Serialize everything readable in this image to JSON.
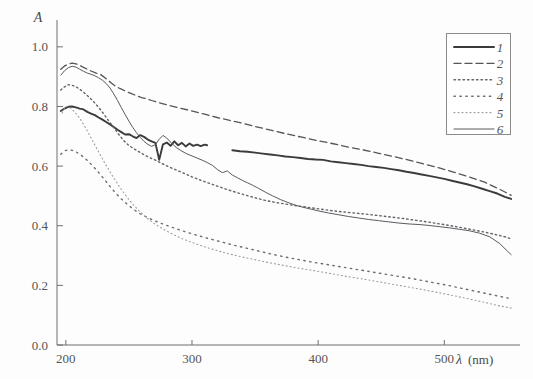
{
  "chart_data": {
    "type": "line",
    "title": "",
    "subtitle": "",
    "xlabel": "λ (nm)",
    "xlabel_symbol": "λ",
    "xlabel_unit": "(nm)",
    "ylabel": "A",
    "xlim": [
      193,
      560
    ],
    "ylim": [
      0.0,
      1.09
    ],
    "grid": false,
    "legend_position": "top-right",
    "xticks": [
      200,
      300,
      400,
      500
    ],
    "xtick_labels": [
      "200",
      "300",
      "400",
      "500"
    ],
    "yticks": [
      0.0,
      0.2,
      0.4,
      0.6,
      0.8,
      1.0
    ],
    "ytick_labels": [
      "0.0",
      "0.2",
      "0.4",
      "0.6",
      "0.8",
      "1.0"
    ],
    "series": [
      {
        "name": "1",
        "legend_label": "1",
        "style": "solid-thick",
        "color": "#3b3b3b",
        "width": 1.9,
        "dash": "",
        "note": "thick solid, data gap between 312 and 332 nm",
        "segments": [
          {
            "x": [
              196,
              199,
              202,
              205,
              208,
              211,
              214,
              217,
              220,
              223,
              226,
              229,
              232,
              235,
              238,
              241,
              244,
              247,
              250,
              253,
              256,
              259,
              262,
              265,
              268,
              271,
              274,
              277,
              280,
              283,
              286,
              289,
              292,
              295,
              298,
              301,
              304,
              307,
              310,
              312
            ],
            "y": [
              0.785,
              0.793,
              0.799,
              0.8,
              0.797,
              0.793,
              0.79,
              0.782,
              0.776,
              0.771,
              0.763,
              0.756,
              0.748,
              0.74,
              0.731,
              0.722,
              0.714,
              0.706,
              0.707,
              0.7,
              0.694,
              0.704,
              0.698,
              0.689,
              0.683,
              0.678,
              0.621,
              0.673,
              0.679,
              0.668,
              0.683,
              0.67,
              0.678,
              0.666,
              0.676,
              0.668,
              0.672,
              0.667,
              0.672,
              0.67
            ]
          },
          {
            "x": [
              332,
              338,
              344,
              350,
              356,
              362,
              368,
              374,
              380,
              386,
              392,
              398,
              404,
              410,
              416,
              422,
              428,
              434,
              440,
              446,
              452,
              458,
              464,
              470,
              476,
              482,
              488,
              494,
              500,
              506,
              512,
              518,
              524,
              530,
              536,
              542,
              548,
              553
            ],
            "y": [
              0.653,
              0.65,
              0.648,
              0.645,
              0.642,
              0.639,
              0.636,
              0.632,
              0.63,
              0.627,
              0.624,
              0.622,
              0.621,
              0.616,
              0.613,
              0.61,
              0.607,
              0.604,
              0.6,
              0.597,
              0.594,
              0.59,
              0.586,
              0.581,
              0.577,
              0.572,
              0.567,
              0.562,
              0.557,
              0.551,
              0.545,
              0.539,
              0.532,
              0.524,
              0.516,
              0.508,
              0.497,
              0.49
            ]
          }
        ]
      },
      {
        "name": "2",
        "legend_label": "2",
        "style": "dashed",
        "color": "#55555a",
        "width": 1.3,
        "dash": "7,4",
        "note": "dashed, highest curve, peak 0.945 near 205 nm",
        "segments": [
          {
            "x": [
              196,
              199,
              202,
              205,
              208,
              211,
              214,
              217,
              220,
              224,
              228,
              232,
              236,
              240,
              244,
              248,
              252,
              256,
              260,
              264,
              268,
              272,
              278,
              284,
              290,
              296,
              302,
              310,
              320,
              330,
              340,
              352,
              364,
              376,
              388,
              400,
              412,
              424,
              436,
              448,
              460,
              472,
              484,
              496,
              508,
              520,
              532,
              544,
              553
            ],
            "y": [
              0.925,
              0.936,
              0.942,
              0.945,
              0.943,
              0.938,
              0.931,
              0.925,
              0.919,
              0.912,
              0.906,
              0.893,
              0.879,
              0.866,
              0.858,
              0.85,
              0.843,
              0.836,
              0.83,
              0.826,
              0.82,
              0.815,
              0.808,
              0.801,
              0.795,
              0.789,
              0.783,
              0.774,
              0.763,
              0.753,
              0.744,
              0.731,
              0.719,
              0.707,
              0.696,
              0.685,
              0.675,
              0.664,
              0.654,
              0.643,
              0.632,
              0.62,
              0.607,
              0.594,
              0.579,
              0.563,
              0.546,
              0.522,
              0.502
            ]
          }
        ]
      },
      {
        "name": "3",
        "legend_label": "3",
        "style": "dotted-medium",
        "color": "#63636a",
        "width": 1.4,
        "dash": "1.5,3",
        "note": "medium dotted, peak 0.873 near 203 nm",
        "segments": [
          {
            "x": [
              196,
              199,
              202,
              205,
              208,
              211,
              214,
              218,
              222,
              226,
              230,
              234,
              238,
              242,
              246,
              250,
              254,
              258,
              262,
              266,
              270,
              276,
              282,
              288,
              294,
              300,
              308,
              318,
              328,
              338,
              348,
              358,
              368,
              378,
              388,
              398,
              408,
              418,
              428,
              438,
              448,
              458,
              468,
              478,
              488,
              498,
              508,
              518,
              528,
              538,
              548,
              553
            ],
            "y": [
              0.855,
              0.866,
              0.873,
              0.871,
              0.866,
              0.858,
              0.848,
              0.833,
              0.816,
              0.797,
              0.775,
              0.752,
              0.729,
              0.706,
              0.685,
              0.669,
              0.658,
              0.648,
              0.638,
              0.629,
              0.622,
              0.609,
              0.597,
              0.586,
              0.575,
              0.564,
              0.551,
              0.536,
              0.521,
              0.508,
              0.496,
              0.485,
              0.477,
              0.47,
              0.464,
              0.458,
              0.452,
              0.447,
              0.443,
              0.439,
              0.434,
              0.429,
              0.424,
              0.418,
              0.412,
              0.405,
              0.398,
              0.39,
              0.382,
              0.373,
              0.363,
              0.356
            ]
          }
        ]
      },
      {
        "name": "4",
        "legend_label": "4",
        "style": "dotted-sparse",
        "color": "#6b6b72",
        "width": 1.4,
        "dash": "1.4,4.5",
        "note": "sparse dotted, peak 0.655 near 203 nm",
        "segments": [
          {
            "x": [
              196,
              199,
              202,
              205,
              208,
              211,
              215,
              219,
              223,
              227,
              231,
              235,
              239,
              243,
              247,
              251,
              255,
              259,
              263,
              268,
              273,
              280,
              288,
              296,
              304,
              314,
              324,
              334,
              344,
              354,
              364,
              374,
              384,
              394,
              404,
              414,
              424,
              434,
              444,
              454,
              464,
              474,
              484,
              494,
              504,
              514,
              524,
              534,
              544,
              553
            ],
            "y": [
              0.64,
              0.651,
              0.655,
              0.653,
              0.648,
              0.64,
              0.627,
              0.611,
              0.593,
              0.574,
              0.553,
              0.532,
              0.512,
              0.494,
              0.478,
              0.464,
              0.451,
              0.44,
              0.431,
              0.421,
              0.412,
              0.401,
              0.389,
              0.378,
              0.368,
              0.356,
              0.345,
              0.334,
              0.324,
              0.314,
              0.304,
              0.295,
              0.287,
              0.279,
              0.272,
              0.265,
              0.258,
              0.251,
              0.244,
              0.237,
              0.23,
              0.223,
              0.215,
              0.207,
              0.199,
              0.19,
              0.181,
              0.172,
              0.163,
              0.155
            ]
          }
        ]
      },
      {
        "name": "5",
        "legend_label": "5",
        "style": "dotted-fine",
        "color": "#9a9aa0",
        "width": 1.1,
        "dash": "1,3",
        "note": "fine faint dotted, steep drop from 0.80 at 200 nm",
        "segments": [
          {
            "x": [
              197,
              200,
              203,
              206,
              209,
              212,
              215,
              218,
              221,
              224,
              227,
              230,
              234,
              238,
              242,
              246,
              250,
              254,
              258,
              262,
              266,
              270,
              275,
              280,
              286,
              292,
              298,
              306,
              314,
              322,
              330,
              340,
              350,
              360,
              370,
              380,
              390,
              400,
              412,
              424,
              436,
              448,
              460,
              472,
              484,
              496,
              508,
              520,
              532,
              544,
              553
            ],
            "y": [
              0.778,
              0.8,
              0.797,
              0.786,
              0.772,
              0.754,
              0.733,
              0.71,
              0.687,
              0.663,
              0.64,
              0.617,
              0.588,
              0.56,
              0.534,
              0.51,
              0.488,
              0.468,
              0.45,
              0.434,
              0.42,
              0.408,
              0.394,
              0.382,
              0.369,
              0.357,
              0.347,
              0.335,
              0.324,
              0.314,
              0.305,
              0.295,
              0.286,
              0.277,
              0.269,
              0.261,
              0.254,
              0.247,
              0.238,
              0.229,
              0.221,
              0.212,
              0.203,
              0.194,
              0.185,
              0.175,
              0.165,
              0.154,
              0.143,
              0.131,
              0.124
            ]
          }
        ]
      },
      {
        "name": "6",
        "legend_label": "6",
        "style": "solid-thin",
        "color": "#5a5a60",
        "width": 1.0,
        "dash": "",
        "note": "thin solid, peak 0.935 near 206 nm, noisy mid-range",
        "segments": [
          {
            "x": [
              196,
              199,
              202,
              205,
              208,
              211,
              214,
              217,
              220,
              223,
              226,
              229,
              232,
              235,
              238,
              241,
              244,
              247,
              250,
              253,
              256,
              259,
              262,
              265,
              268,
              271,
              274,
              277,
              280,
              284,
              288,
              292,
              296,
              300,
              304,
              308,
              312,
              316,
              320,
              324,
              328,
              332,
              336,
              340,
              344,
              348,
              352,
              358,
              364,
              370,
              376,
              382,
              388,
              394,
              400,
              408,
              416,
              424,
              432,
              440,
              448,
              456,
              464,
              472,
              480,
              488,
              496,
              504,
              512,
              520,
              528,
              536,
              544,
              550,
              553
            ],
            "y": [
              0.905,
              0.92,
              0.93,
              0.935,
              0.932,
              0.925,
              0.918,
              0.912,
              0.908,
              0.903,
              0.896,
              0.888,
              0.877,
              0.862,
              0.842,
              0.82,
              0.796,
              0.773,
              0.751,
              0.73,
              0.712,
              0.696,
              0.683,
              0.673,
              0.666,
              0.672,
              0.69,
              0.703,
              0.694,
              0.676,
              0.661,
              0.65,
              0.641,
              0.634,
              0.627,
              0.62,
              0.612,
              0.603,
              0.589,
              0.578,
              0.584,
              0.57,
              0.561,
              0.552,
              0.544,
              0.536,
              0.527,
              0.513,
              0.5,
              0.488,
              0.478,
              0.469,
              0.462,
              0.456,
              0.45,
              0.443,
              0.437,
              0.431,
              0.426,
              0.421,
              0.417,
              0.413,
              0.409,
              0.406,
              0.404,
              0.401,
              0.397,
              0.393,
              0.388,
              0.383,
              0.375,
              0.363,
              0.34,
              0.315,
              0.303
            ]
          }
        ]
      }
    ]
  },
  "legend": {
    "entries": [
      {
        "label": "1",
        "style": "solid-thick"
      },
      {
        "label": "2",
        "style": "dashed"
      },
      {
        "label": "3",
        "style": "dotted-medium"
      },
      {
        "label": "4",
        "style": "dotted-sparse"
      },
      {
        "label": "5",
        "style": "dotted-fine"
      },
      {
        "label": "6",
        "style": "solid-thin"
      }
    ]
  },
  "colors": {
    "axis": "#6f6f6f",
    "text": "#555555",
    "background": "#fdfdfd",
    "legend_border": "#8a8a8a"
  }
}
